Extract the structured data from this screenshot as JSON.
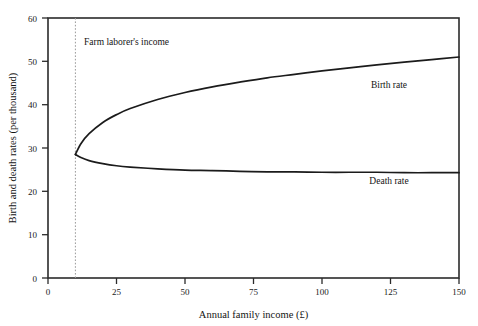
{
  "chart_data": {
    "type": "line",
    "title": "",
    "xlabel": "Annual family income (£)",
    "ylabel": "Birth and death rates (per thousand)",
    "xlim": [
      0,
      150
    ],
    "ylim": [
      0,
      60
    ],
    "xticks": [
      "0",
      "25",
      "50",
      "75",
      "100",
      "125",
      "150"
    ],
    "xtick_values": [
      0,
      25,
      50,
      75,
      100,
      125,
      150
    ],
    "yticks": [
      "0",
      "10",
      "20",
      "30",
      "40",
      "50",
      "60"
    ],
    "ytick_values": [
      0,
      10,
      20,
      30,
      40,
      50,
      60
    ],
    "grid": false,
    "legend_position": "inline-curve-labels",
    "annotations": [
      {
        "name": "farm-laborer-income",
        "text": "Farm laborer's income",
        "x": 10,
        "kind": "vertical-dotted-line"
      }
    ],
    "series": [
      {
        "name": "Birth rate",
        "label": "Birth rate",
        "color": "#1b1b1b",
        "x": [
          10,
          12,
          15,
          20,
          25,
          30,
          40,
          50,
          60,
          70,
          80,
          90,
          100,
          110,
          120,
          130,
          140,
          150
        ],
        "values": [
          28.5,
          31.0,
          33.3,
          35.9,
          37.7,
          39.1,
          41.2,
          42.8,
          44.1,
          45.2,
          46.2,
          47.0,
          47.8,
          48.5,
          49.2,
          49.8,
          50.4,
          51.0
        ]
      },
      {
        "name": "Death rate",
        "label": "Death rate",
        "color": "#1b1b1b",
        "x": [
          10,
          12,
          15,
          20,
          25,
          30,
          40,
          50,
          60,
          70,
          80,
          90,
          100,
          110,
          120,
          130,
          140,
          150
        ],
        "values": [
          28.5,
          27.8,
          27.1,
          26.4,
          25.9,
          25.6,
          25.2,
          24.9,
          24.8,
          24.6,
          24.5,
          24.5,
          24.4,
          24.4,
          24.4,
          24.3,
          24.3,
          24.3
        ]
      }
    ]
  },
  "labels": {
    "birth_rate": "Birth rate",
    "death_rate": "Death rate",
    "farm_annotation": "Farm laborer's income",
    "x_axis_title": "Annual family income (£)",
    "y_axis_title": "Birth and death rates (per thousand)"
  }
}
